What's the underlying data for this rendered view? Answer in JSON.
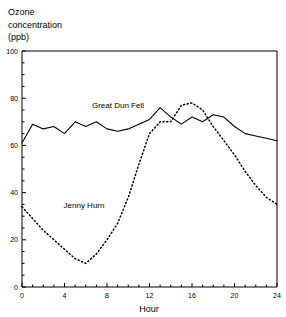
{
  "chart_data": {
    "type": "line",
    "title": "",
    "subtitle": "",
    "ylabel_lines": [
      "Ozone",
      "concentration",
      "(ppb)"
    ],
    "ylabel": "Ozone concentration (ppb)",
    "xlabel": "Hour",
    "xlim": [
      0,
      24
    ],
    "ylim": [
      0,
      100
    ],
    "xticks": [
      0,
      4,
      8,
      12,
      16,
      20,
      24
    ],
    "xtick_labels": [
      "0",
      "4",
      "8",
      "12",
      "16",
      "20",
      "24"
    ],
    "x_minor_tick_step": 1,
    "yticks": [
      0,
      20,
      40,
      60,
      80,
      100
    ],
    "ytick_labels": [
      "0",
      "20",
      "40",
      "60",
      "80",
      "100"
    ],
    "y_minor_tick_step": 5,
    "grid": false,
    "legend_position": "inline-annotations",
    "x": [
      0,
      1,
      2,
      3,
      4,
      5,
      6,
      7,
      8,
      9,
      10,
      11,
      12,
      13,
      14,
      15,
      16,
      17,
      18,
      19,
      20,
      21,
      22,
      23,
      24
    ],
    "series": [
      {
        "name": "Great Dun Fell",
        "style": "solid",
        "color": "#000000",
        "annotation": "Great Dun Fell",
        "values": [
          61,
          69,
          67,
          68,
          65,
          70,
          68,
          70,
          67,
          66,
          67,
          69,
          71,
          76,
          72,
          69,
          72,
          70,
          73,
          72,
          68,
          65,
          64,
          63,
          62
        ]
      },
      {
        "name": "Jenny Hurn",
        "style": "dotted",
        "color": "#000000",
        "annotation": "Jenny Hurn",
        "values": [
          34,
          29,
          24,
          20,
          16,
          12,
          10,
          14,
          20,
          27,
          38,
          52,
          65,
          70,
          70,
          77,
          78,
          75,
          68,
          62,
          56,
          49,
          43,
          38,
          35
        ]
      }
    ]
  },
  "annotations": {
    "great_dun_fell": "Great Dun Fell",
    "jenny_hurn": "Jenny Hurn"
  }
}
